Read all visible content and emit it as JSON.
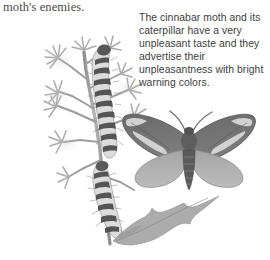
{
  "page": {
    "width": 270,
    "height": 260,
    "background_color": "#ffffff"
  },
  "running_text": {
    "text": "moth's enemies.",
    "color": "#4a4a4a"
  },
  "caption": {
    "text": "The cinnabar moth and its caterpillar have a very unpleasant taste and they advertise their unpleasantness with bright warning colors.",
    "color": "#3e3e3e"
  },
  "illustration": {
    "subject": "cinnabar-moth-and-caterpillar-on-ragwort",
    "style": "grayscale-halftone-drawing",
    "colors": {
      "plant_foliage": "#a8a8a8",
      "plant_stem": "#9a9a9a",
      "caterpillar_dark_band": "#4f4f4f",
      "caterpillar_light_band": "#e2e2e2",
      "moth_forewing": "#6e6e6e",
      "moth_forewing_marking": "#dcdcdc",
      "moth_hindwing": "#b0b0b0",
      "moth_body": "#5a5a5a"
    },
    "parts": [
      {
        "name": "ragwort-plant",
        "label": "ragwort plant"
      },
      {
        "name": "caterpillar-upper",
        "label": "cinnabar moth caterpillar (upper)"
      },
      {
        "name": "caterpillar-lower",
        "label": "cinnabar moth caterpillar (lower)"
      },
      {
        "name": "adult-moth",
        "label": "adult cinnabar moth with spread wings"
      },
      {
        "name": "ragwort-leaf",
        "label": "lobed ragwort leaf"
      }
    ]
  }
}
